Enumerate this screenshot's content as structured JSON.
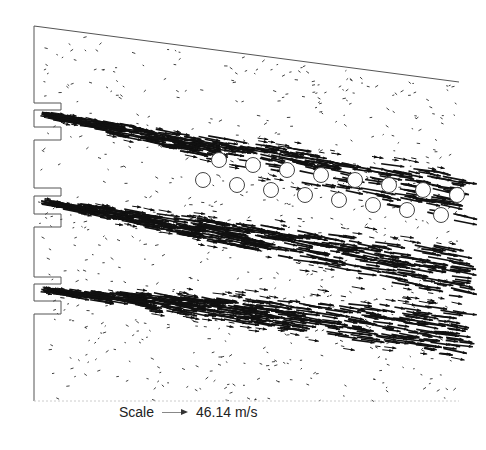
{
  "figure": {
    "type": "velocity-vector-field",
    "inlet_jets": 3,
    "obstacle_rows": 2,
    "obstacles_per_row": 8
  },
  "legend": {
    "label": "Scale",
    "value": "46.14 m/s",
    "arrow_icon": "arrow-right-icon"
  },
  "colors": {
    "vector": "#111111",
    "boundary": "#555555",
    "obstacle": "#444444"
  }
}
